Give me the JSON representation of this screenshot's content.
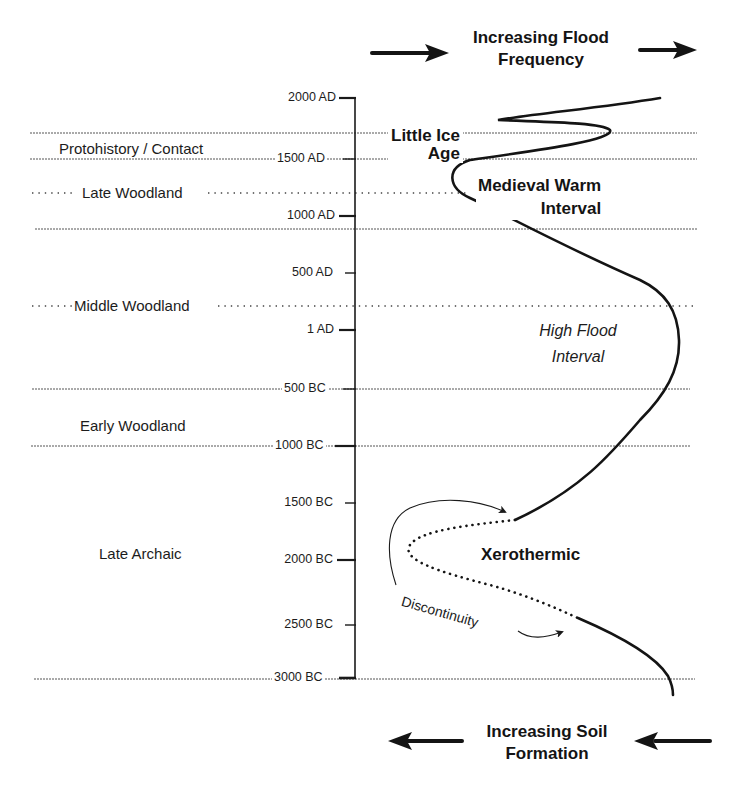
{
  "header": {
    "top_title_line1": "Increasing Flood",
    "top_title_line2": "Frequency",
    "bottom_title_line1": "Increasing Soil",
    "bottom_title_line2": "Formation"
  },
  "axis": {
    "ticks": [
      {
        "label": "2000 AD",
        "y": 98
      },
      {
        "label": "1500 AD",
        "y": 159
      },
      {
        "label": "1000 AD",
        "y": 216
      },
      {
        "label": "500 AD",
        "y": 273
      },
      {
        "label": "1 AD",
        "y": 330
      },
      {
        "label": "500 BC",
        "y": 389
      },
      {
        "label": "1000 BC",
        "y": 446
      },
      {
        "label": "1500 BC",
        "y": 503
      },
      {
        "label": "2000 BC",
        "y": 560
      },
      {
        "label": "2500 BC",
        "y": 625
      },
      {
        "label": "3000 BC",
        "y": 678
      }
    ]
  },
  "periods": [
    {
      "label": "Protohistory / Contact"
    },
    {
      "label": "Late Woodland"
    },
    {
      "label": "Middle Woodland"
    },
    {
      "label": "Early Woodland"
    },
    {
      "label": "Late Archaic"
    }
  ],
  "annotations": {
    "little_ice_age_line1": "Little Ice",
    "little_ice_age_line2": "Age",
    "medieval_line1": "Medieval Warm",
    "medieval_line2": "Interval",
    "high_flood_line1": "High Flood",
    "high_flood_line2": "Interval",
    "xerothermic": "Xerothermic",
    "discontinuity": "Discontinuity"
  },
  "colors": {
    "ink": "#1a1a1a",
    "background": "#ffffff",
    "guide_line": "#555555"
  }
}
